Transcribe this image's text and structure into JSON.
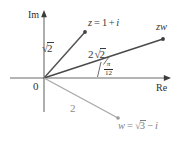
{
  "figure": {
    "type": "complex-plane-argand-diagram",
    "width": 186,
    "height": 143,
    "background": "#ffffff"
  },
  "axes": {
    "imaginary_label": "Im",
    "real_label": "Re",
    "origin_label": "0",
    "origin_px": {
      "x": 44,
      "y": 78
    },
    "real_axis_color": "#6b6b6b",
    "imaginary_axis_color": "#6b6b6b"
  },
  "vectors": [
    {
      "id": "z",
      "label": "z = 1 + i",
      "label_parts": {
        "name": "z",
        "equals": "=",
        "real": "1",
        "plus": "+",
        "imag": "i"
      },
      "magnitude_label": "2",
      "magnitude_radical": true,
      "magnitude_text": "√2",
      "color": "#555555",
      "endpoint_px": {
        "x": 85,
        "y": 32
      },
      "has_endpoint_dot": true
    },
    {
      "id": "zw",
      "label": "zw",
      "magnitude_label": "2",
      "magnitude_coefficient": "2",
      "magnitude_radical": true,
      "magnitude_text": "2√2",
      "color": "#4a4a4a",
      "endpoint_px": {
        "x": 163,
        "y": 39
      },
      "has_endpoint_dot": true,
      "angle_label_numerator": "π",
      "angle_label_denominator": "12",
      "angle_text": "π/12"
    },
    {
      "id": "w",
      "label": "w = √3 − i",
      "label_parts": {
        "name": "w",
        "equals": "=",
        "radicand": "3",
        "minus": "−",
        "imag": "i"
      },
      "magnitude_label": "2",
      "magnitude_radical": false,
      "magnitude_text": "2",
      "color": "#a9a9a9",
      "endpoint_px": {
        "x": 118,
        "y": 118
      },
      "has_endpoint_dot": true
    }
  ],
  "colors": {
    "ink": "#3a3a3a",
    "axis": "#6b6b6b",
    "z_ray": "#555555",
    "zw_ray": "#4a4a4a",
    "w_ray": "#a9a9a9",
    "background": "#ffffff"
  }
}
